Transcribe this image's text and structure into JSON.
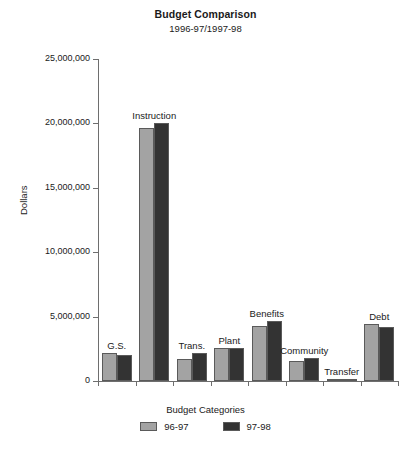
{
  "chart_data": {
    "type": "bar",
    "title": "Budget Comparison",
    "subtitle": "1996-97/1997-98",
    "xlabel": "Budget Categories",
    "ylabel": "Dollars",
    "ylim": [
      0,
      25000000
    ],
    "ytick_labels": [
      "25,000,000",
      "20,000,000",
      "15,000,000",
      "10,000,000",
      "5,000,000",
      "0"
    ],
    "ytick_values": [
      25000000,
      20000000,
      15000000,
      10000000,
      5000000,
      0
    ],
    "grid": false,
    "legend_position": "bottom",
    "categories": [
      "G.S.",
      "Instruction",
      "Trans.",
      "Plant",
      "Benefits",
      "Community",
      "Transfer",
      "Debt"
    ],
    "series": [
      {
        "name": "96-97",
        "color": "#a3a3a3",
        "values": [
          2200000,
          19650000,
          1700000,
          2550000,
          4250000,
          1550000,
          80000,
          4400000
        ]
      },
      {
        "name": "97-98",
        "color": "#333333",
        "values": [
          2050000,
          20050000,
          2200000,
          2550000,
          4650000,
          1750000,
          120000,
          4200000
        ]
      }
    ]
  },
  "colors": {
    "axis": "#6e6e6e",
    "bar_outline": "#5a5a5a",
    "series_96_97": "#a3a3a3",
    "series_97_98": "#333333",
    "text": "#1a1a1a"
  }
}
